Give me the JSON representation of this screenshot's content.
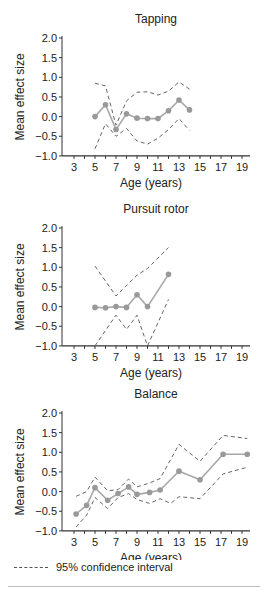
{
  "chart_data": [
    {
      "type": "line",
      "title": "Tapping",
      "xlabel": "Age (years)",
      "ylabel": "Mean effect size",
      "xticks": [
        3,
        5,
        7,
        9,
        11,
        13,
        15,
        17,
        19
      ],
      "yticks": [
        "2.0",
        "1.5",
        "1.0",
        "0.5",
        "0.0",
        "−0.5",
        "−1.0"
      ],
      "ylim": [
        -1.0,
        2.0
      ],
      "xlim": [
        2,
        19.7
      ],
      "grid": false,
      "series": [
        {
          "name": "Mean effect size",
          "x": [
            5,
            6,
            7,
            8,
            9,
            10,
            11,
            12,
            13,
            14
          ],
          "values": [
            0.0,
            0.3,
            -0.33,
            0.07,
            -0.04,
            -0.05,
            -0.05,
            0.15,
            0.42,
            0.17
          ]
        },
        {
          "name": "95% CI upper",
          "x": [
            5,
            6,
            7,
            8,
            9,
            10,
            11,
            12,
            13,
            14
          ],
          "values": [
            0.85,
            0.78,
            -0.22,
            0.4,
            0.62,
            0.63,
            0.55,
            0.65,
            0.88,
            0.7
          ]
        },
        {
          "name": "95% CI lower",
          "x": [
            5,
            6,
            7,
            8,
            9,
            10,
            11,
            12,
            13,
            14
          ],
          "values": [
            -0.82,
            -0.18,
            -0.5,
            -0.3,
            -0.62,
            -0.7,
            -0.55,
            -0.33,
            -0.05,
            -0.35
          ]
        }
      ]
    },
    {
      "type": "line",
      "title": "Pursuit rotor",
      "xlabel": "Age (years)",
      "ylabel": "Mean effect size",
      "xticks": [
        3,
        5,
        7,
        9,
        11,
        13,
        15,
        17,
        19
      ],
      "yticks": [
        "2.0",
        "1.5",
        "1.0",
        "0.5",
        "0.0",
        "−0.5",
        "−1.0"
      ],
      "ylim": [
        -1.0,
        2.0
      ],
      "xlim": [
        2,
        19.7
      ],
      "grid": false,
      "series": [
        {
          "name": "Mean effect size",
          "x": [
            5,
            6,
            7,
            8,
            9,
            10,
            12
          ],
          "values": [
            -0.02,
            -0.03,
            0.0,
            -0.02,
            0.3,
            0.0,
            0.82
          ]
        },
        {
          "name": "95% CI upper",
          "x": [
            5,
            7,
            9,
            10,
            12
          ],
          "values": [
            1.03,
            0.27,
            0.8,
            0.97,
            1.5
          ]
        },
        {
          "name": "95% CI lower",
          "x": [
            5,
            7,
            8,
            9,
            10,
            12
          ],
          "values": [
            -1.0,
            -0.22,
            -0.58,
            -0.22,
            -1.0,
            0.18
          ]
        }
      ]
    },
    {
      "type": "line",
      "title": "Balance",
      "xlabel": "Age (years)",
      "ylabel": "Mean effect size",
      "xticks": [
        3,
        5,
        7,
        9,
        11,
        13,
        15,
        17,
        19
      ],
      "yticks": [
        "2.0",
        "1.5",
        "1.0",
        "0.5",
        "0.0",
        "−0.5",
        "−1.0"
      ],
      "ylim": [
        -1.0,
        2.0
      ],
      "xlim": [
        2,
        19.7
      ],
      "grid": false,
      "series": [
        {
          "name": "Mean effect size",
          "x": [
            3.2,
            4.2,
            5,
            6.2,
            7.2,
            8.2,
            9,
            10.2,
            11.2,
            13,
            15,
            17.2,
            19.5
          ],
          "values": [
            -0.57,
            -0.35,
            0.1,
            -0.22,
            -0.05,
            0.12,
            -0.07,
            -0.02,
            0.04,
            0.52,
            0.3,
            0.95,
            0.95
          ]
        },
        {
          "name": "95% CI upper",
          "x": [
            3.2,
            4.2,
            5,
            6.2,
            7.2,
            8.2,
            9,
            10.2,
            11.2,
            13,
            15,
            17.2,
            19.5
          ],
          "values": [
            -0.12,
            0.0,
            0.37,
            0.02,
            0.05,
            0.32,
            0.12,
            0.22,
            0.33,
            1.2,
            0.77,
            1.43,
            1.35
          ]
        },
        {
          "name": "95% CI lower",
          "x": [
            3.2,
            4.2,
            5,
            6.2,
            7.2,
            8.2,
            9,
            10.2,
            11.2,
            12.2,
            13,
            15,
            17.2,
            19.5
          ],
          "values": [
            -0.9,
            -0.6,
            -0.15,
            -0.43,
            -0.15,
            -0.05,
            -0.2,
            -0.3,
            -0.18,
            -0.3,
            -0.13,
            -0.18,
            0.45,
            0.62
          ]
        }
      ]
    }
  ],
  "legend": {
    "label": "95% confidence interval",
    "style": "dashed"
  },
  "colors": {
    "mean_line": "#a8a8a8",
    "mean_marker": "#999999",
    "ci_line": "#666666",
    "axis": "#333333"
  }
}
